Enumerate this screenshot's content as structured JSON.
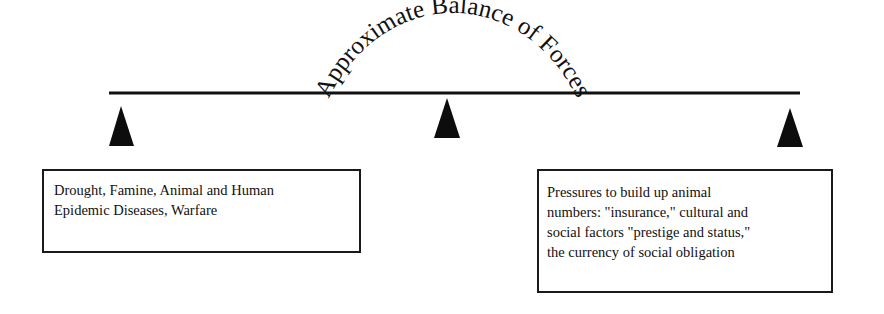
{
  "diagram": {
    "title_arc": "Approximate Balance of Forces",
    "left_box": {
      "lines": [
        "Drought, Famine, Animal and Human",
        "Epidemic Diseases, Warfare"
      ]
    },
    "right_box": {
      "lines": [
        "Pressures to build up animal",
        "numbers: \"insurance,\" cultural and",
        "social factors \"prestige and status,\"",
        "the currency of social obligation"
      ]
    },
    "elements": {
      "beam": "horizontal balance beam",
      "fulcrums": [
        "left-fulcrum",
        "center-fulcrum",
        "right-fulcrum"
      ]
    },
    "colors": {
      "ink": "#111111",
      "background": "#ffffff"
    }
  }
}
